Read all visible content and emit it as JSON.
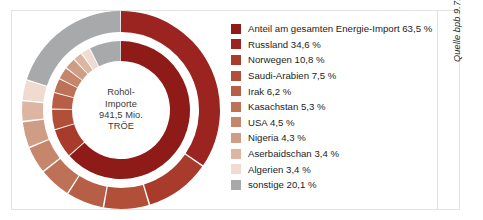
{
  "center": {
    "line1": "Rohöl-",
    "line2": "Importe",
    "line3": "941,5 Mio.",
    "line4": "TRÖE"
  },
  "source": {
    "text": "Quelle bpb 9.7.2019"
  },
  "legend": {
    "items": [
      {
        "label": "Anteil am gesamten Energie-Import 63,5 %",
        "color": "#8e1b18"
      },
      {
        "label": "Russland 34,6 %",
        "color": "#9b2420"
      },
      {
        "label": "Norwegen 10,8 %",
        "color": "#a83b2c"
      },
      {
        "label": "Saudi-Arabien 7,5 %",
        "color": "#b24f38"
      },
      {
        "label": "Irak 6,2 %",
        "color": "#b75f46"
      },
      {
        "label": "Kasachstan 5,3 %",
        "color": "#bd7258"
      },
      {
        "label": "USA 4,5 %",
        "color": "#c5866c"
      },
      {
        "label": "Nigeria 4,3 %",
        "color": "#cf9c85"
      },
      {
        "label": "Aserbaidschan 3,4 %",
        "color": "#ddb6a3"
      },
      {
        "label": "Algerien 3,4 %",
        "color": "#efdbd0"
      },
      {
        "label": "sonstige 20,1 %",
        "color": "#a8a9ab"
      }
    ]
  },
  "chart_data": {
    "type": "pie",
    "subtitle": "",
    "xlabel": "",
    "ylabel": "",
    "unit": "%",
    "legend_position": "right",
    "grid": false,
    "annotations": [
      "Rohöl-Importe 941,5 Mio. TRÖE",
      "Quelle bpb 9.7.2019"
    ],
    "rings": [
      {
        "name": "outer",
        "description": "Rohöl-Importe nach Herkunftsland",
        "categories": [
          "Russland",
          "Norwegen",
          "Saudi-Arabien",
          "Irak",
          "Kasachstan",
          "USA",
          "Nigeria",
          "Aserbaidschan",
          "Algerien",
          "sonstige"
        ],
        "values": [
          34.6,
          10.8,
          7.5,
          6.2,
          5.3,
          4.5,
          4.3,
          3.4,
          3.4,
          20.1
        ],
        "colors": [
          "#9b2420",
          "#a83b2c",
          "#b24f38",
          "#b75f46",
          "#bd7258",
          "#c5866c",
          "#cf9c85",
          "#ddb6a3",
          "#efdbd0",
          "#a8a9ab"
        ]
      },
      {
        "name": "inner",
        "description": "Anteil am gesamten Energie-Import",
        "categories": [
          "Anteil am gesamten Energie-Import",
          "Norwegen",
          "Saudi-Arabien",
          "Irak",
          "Kasachstan",
          "USA",
          "Nigeria",
          "Aserbaidschan",
          "Algerien",
          "sonstige"
        ],
        "values": [
          63.5,
          6.9,
          4.8,
          3.9,
          3.4,
          2.9,
          2.7,
          2.2,
          2.2,
          7.5
        ],
        "colors": [
          "#8e1b18",
          "#a83b2c",
          "#b24f38",
          "#b75f46",
          "#bd7258",
          "#c5866c",
          "#cf9c85",
          "#ddb6a3",
          "#efdbd0",
          "#a8a9ab"
        ]
      }
    ]
  },
  "style": {
    "card_border": "#e3e3e3",
    "background": "#ffffff",
    "accent": "#8e1b18"
  }
}
